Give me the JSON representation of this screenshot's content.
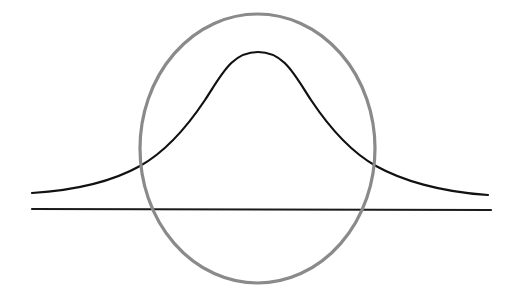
{
  "diagram": {
    "title": "",
    "colors": {
      "background": "#ffffff",
      "curve": "#111111",
      "baseline": "#1a1a1a",
      "ellipse": "#8a8a8a"
    },
    "elements": {
      "bell_curve": {
        "path": "M32,193 C80,190 115,180 140,166 C165,152 185,130 205,100 C222,74 232,52 258,52 C284,52 294,74 311,100 C331,130 351,152 376,166 C401,180 440,192 488,195",
        "stroke_width": 2.2
      },
      "baseline": {
        "x1": 32,
        "y1": 209,
        "x2": 491,
        "y2": 210,
        "stroke_width": 2.2
      },
      "ellipse": {
        "cx": 257.5,
        "cy": 148.5,
        "rx": 117.5,
        "ry": 134.5,
        "stroke_width": 3.2
      }
    }
  }
}
